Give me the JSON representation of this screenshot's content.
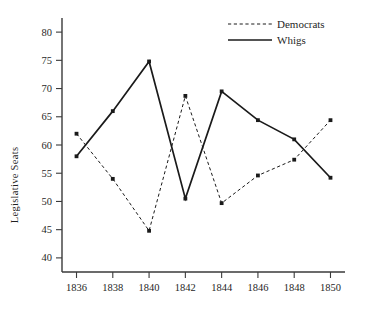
{
  "chart_data": {
    "type": "line",
    "title": "",
    "xlabel": "",
    "ylabel": "Legislative Seats",
    "x": [
      1836,
      1838,
      1840,
      1842,
      1844,
      1846,
      1848,
      1850
    ],
    "xticklabels": [
      "1836",
      "1838",
      "1840",
      "1842",
      "1844",
      "1846",
      "1848",
      "1850"
    ],
    "yticklabels": [
      "40",
      "45",
      "50",
      "55",
      "60",
      "65",
      "70",
      "75",
      "80"
    ],
    "yticks": [
      40,
      45,
      50,
      55,
      60,
      65,
      70,
      75,
      80
    ],
    "xlim": [
      1835.2,
      1850.8
    ],
    "ylim": [
      37.5,
      82.5
    ],
    "grid": false,
    "legend_position": "top-right",
    "series": [
      {
        "name": "Democrats",
        "style": "dashed",
        "color": "#1a1a1a",
        "marker": "square",
        "values": [
          62.0,
          54.0,
          44.8,
          68.7,
          49.7,
          54.6,
          57.4,
          64.4
        ]
      },
      {
        "name": "Whigs",
        "style": "solid",
        "color": "#1a1a1a",
        "marker": "square",
        "values": [
          58.0,
          66.0,
          74.8,
          50.5,
          69.5,
          64.4,
          61.0,
          54.2
        ]
      }
    ]
  },
  "legend": {
    "entries": [
      {
        "label": "Democrats",
        "style": "dashed"
      },
      {
        "label": "Whigs",
        "style": "solid"
      }
    ]
  },
  "axes": {
    "y_axis_title": "Legislative Seats"
  }
}
